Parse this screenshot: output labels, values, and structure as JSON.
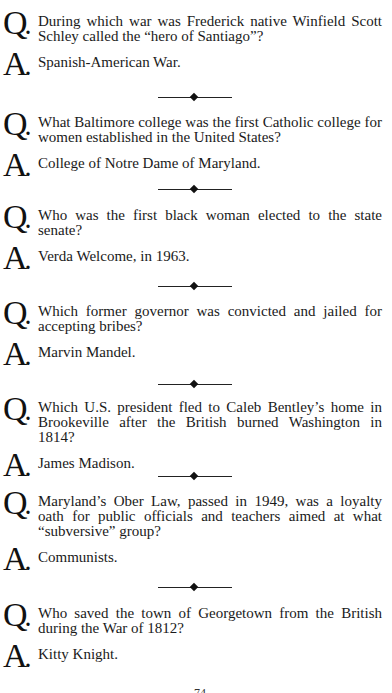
{
  "markers": {
    "question": "Q",
    "answer": "A",
    "dot": "."
  },
  "qa": [
    {
      "question": "During which war was Frederick native Winfield Scott Schley called the “hero of Santiago”?",
      "answer": "Spanish-American War."
    },
    {
      "question": "What Baltimore college was the first Catholic college for women established in the United States?",
      "answer": "College of Notre Dame of Maryland."
    },
    {
      "question": "Who was the first black woman elected to the state senate?",
      "answer": "Verda Welcome, in 1963."
    },
    {
      "question": "Which former governor was convicted and jailed for accepting bribes?",
      "answer": "Marvin Mandel."
    },
    {
      "question": "Which U.S. president fled to Caleb Bentley’s home in Brookeville after the British burned Washington in 1814?",
      "answer": "James Madison."
    },
    {
      "question": "Maryland’s Ober Law, passed in 1949, was a loyalty oath for public officials and teachers aimed at what “subversive” group?",
      "answer": "Communists."
    },
    {
      "question": "Who saved the town of Georgetown from the British during the War of 1812?",
      "answer": "Kitty Knight."
    }
  ],
  "page_number": "74"
}
